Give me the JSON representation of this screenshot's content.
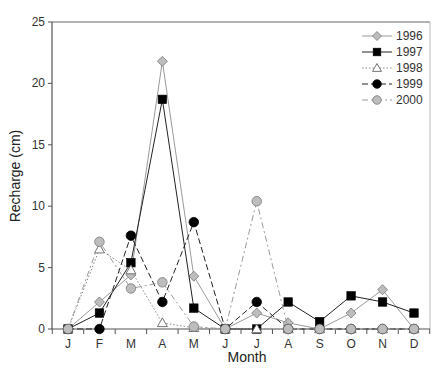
{
  "chart_data": {
    "type": "line",
    "title": "",
    "xlabel": "Month",
    "ylabel": "Recharge (cm)",
    "ylim": [
      0,
      25
    ],
    "yticks": [
      0,
      5,
      10,
      15,
      20,
      25
    ],
    "grid": false,
    "legend_position": "top-right",
    "categories": [
      "J",
      "F",
      "M",
      "A",
      "M",
      "J",
      "J",
      "A",
      "S",
      "O",
      "N",
      "D"
    ],
    "series": [
      {
        "name": "1996",
        "marker": "diamond",
        "marker_fill": "#bdbdbd",
        "line": "solid",
        "line_color": "#9a9a9a",
        "values": [
          0,
          2.2,
          4.4,
          21.8,
          4.3,
          0,
          1.3,
          0.5,
          0,
          1.3,
          3.2,
          0
        ]
      },
      {
        "name": "1997",
        "marker": "square",
        "marker_fill": "#000000",
        "line": "solid",
        "line_color": "#222222",
        "values": [
          0,
          1.3,
          5.4,
          18.7,
          1.7,
          0,
          0,
          2.2,
          0.6,
          2.7,
          2.2,
          1.3
        ]
      },
      {
        "name": "1998",
        "marker": "triangle",
        "marker_fill": "#ffffff",
        "line": "dotted",
        "line_color": "#888888",
        "values": [
          0,
          6.5,
          4.8,
          0.5,
          0.1,
          0,
          0,
          0,
          0,
          0,
          0,
          0
        ]
      },
      {
        "name": "1999",
        "marker": "circle",
        "marker_fill": "#000000",
        "line": "dashed",
        "line_color": "#222222",
        "values": [
          0,
          0,
          7.6,
          2.2,
          8.7,
          0,
          2.2,
          0,
          0,
          0,
          0,
          0
        ]
      },
      {
        "name": "2000",
        "marker": "circle",
        "marker_fill": "#bdbdbd",
        "line": "dashdot",
        "line_color": "#9a9a9a",
        "values": [
          0,
          7.1,
          3.3,
          3.8,
          0.2,
          0,
          10.4,
          0,
          0,
          0,
          0,
          0
        ]
      }
    ]
  }
}
